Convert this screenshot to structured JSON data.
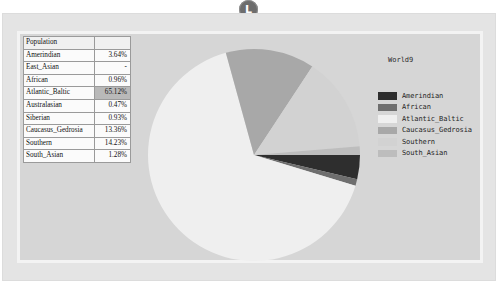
{
  "badge": {
    "label": "L",
    "name": "top-circular-badge"
  },
  "table": {
    "header": {
      "col1": "Population",
      "col2": ""
    },
    "rows": [
      {
        "label": "Amerindian",
        "value": "3.64%",
        "selected": false
      },
      {
        "label": "East_Asian",
        "value": "-",
        "selected": false
      },
      {
        "label": "African",
        "value": "0.96%",
        "selected": false
      },
      {
        "label": "Atlantic_Baltic",
        "value": "65.12%",
        "selected": true
      },
      {
        "label": "Australasian",
        "value": "0.47%",
        "selected": false
      },
      {
        "label": "Siberian",
        "value": "0.93%",
        "selected": false
      },
      {
        "label": "Caucasus_Gedrosia",
        "value": "13.36%",
        "selected": false
      },
      {
        "label": "Southern",
        "value": "14.23%",
        "selected": false
      },
      {
        "label": "South_Asian",
        "value": "1.28%",
        "selected": false
      }
    ]
  },
  "legend": {
    "title": "World9",
    "items": [
      {
        "label": "Amerindian",
        "color": "#2e2e2e"
      },
      {
        "label": "African",
        "color": "#6e6e6e"
      },
      {
        "label": "Atlantic_Baltic",
        "color": "#efefef"
      },
      {
        "label": "Caucasus_Gedrosia",
        "color": "#a8a8a8"
      },
      {
        "label": "Southern",
        "color": "#d2d2d2"
      },
      {
        "label": "South_Asian",
        "color": "#bdbdbd"
      }
    ]
  },
  "chart_data": {
    "type": "pie",
    "title": "World9",
    "labels": [
      "Amerindian",
      "African",
      "Atlantic_Baltic",
      "Caucasus_Gedrosia",
      "Southern",
      "South_Asian"
    ],
    "values": [
      3.64,
      0.96,
      65.12,
      13.36,
      14.23,
      1.28
    ],
    "colors": [
      "#2e2e2e",
      "#6e6e6e",
      "#efefef",
      "#a8a8a8",
      "#d2d2d2",
      "#bdbdbd"
    ],
    "unit": "%",
    "start_angle": 0,
    "direction": "clockwise",
    "legend_position": "right",
    "grid": false,
    "excluded_zero_slices": [
      "East_Asian",
      "Australasian",
      "Siberian"
    ],
    "all_populations": {
      "Amerindian": 3.64,
      "East_Asian": null,
      "African": 0.96,
      "Atlantic_Baltic": 65.12,
      "Australasian": 0.47,
      "Siberian": 0.93,
      "Caucasus_Gedrosia": 13.36,
      "Southern": 14.23,
      "South_Asian": 1.28
    }
  }
}
